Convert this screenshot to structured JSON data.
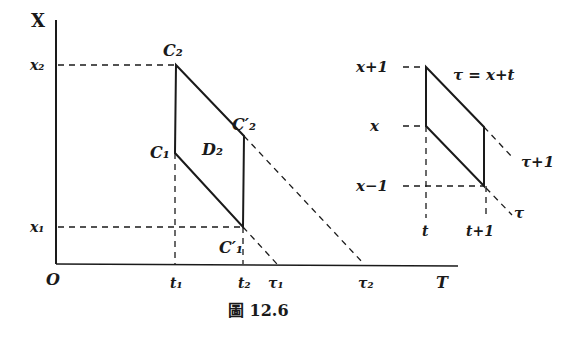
{
  "figure": {
    "caption": "圖 12.6",
    "main_diagram": {
      "axes": {
        "vertical_label": "X",
        "horizontal_label": "T",
        "origin_label": "O"
      },
      "y_ticks": [
        "x₂",
        "x₁"
      ],
      "x_ticks": [
        "t₁",
        "t₂",
        "τ₁",
        "τ₂"
      ],
      "points": {
        "C2": "C₂",
        "C2p": "C′₂",
        "C1": "C₁",
        "C1p": "C′₁"
      },
      "region_label": "D₂"
    },
    "inset_diagram": {
      "y_ticks": [
        "x+1",
        "x",
        "x−1"
      ],
      "x_ticks": [
        "t",
        "t+1"
      ],
      "line_equation": "τ = x+t",
      "diag_labels": [
        "τ+1",
        "τ"
      ]
    }
  },
  "colors": {
    "ink": "#1a1a1a",
    "background": "#ffffff"
  }
}
